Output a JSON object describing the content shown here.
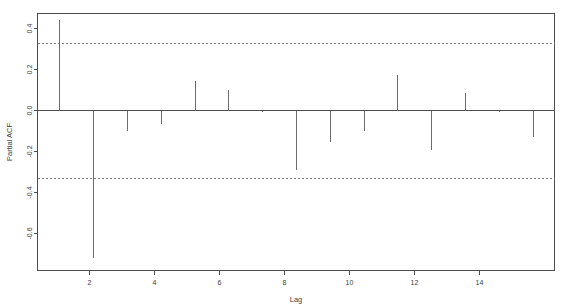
{
  "chart_data": {
    "type": "bar",
    "title": "",
    "subtitle": "",
    "xlabel": "Lag",
    "ylabel": "Partial ACF",
    "categories": [
      1,
      2,
      3,
      4,
      5,
      6,
      7,
      8,
      9,
      10,
      11,
      12,
      13,
      14,
      15
    ],
    "values": [
      0.44,
      -0.72,
      -0.1,
      -0.065,
      0.145,
      0.1,
      -0.005,
      -0.29,
      -0.155,
      -0.1,
      0.175,
      -0.195,
      0.085,
      -0.005,
      -0.13
    ],
    "series": [
      {
        "name": "Partial ACF",
        "values": [
          0.44,
          -0.72,
          -0.1,
          -0.065,
          0.145,
          0.1,
          -0.005,
          -0.29,
          -0.155,
          -0.1,
          0.175,
          -0.195,
          0.085,
          -0.005,
          -0.13
        ]
      }
    ],
    "xlim": [
      0.35,
      15.65
    ],
    "ylim": [
      -0.78,
      0.47
    ],
    "x_ticks": [
      2,
      4,
      6,
      8,
      10,
      12,
      14
    ],
    "x_tick_labels": [
      "2",
      "4",
      "6",
      "8",
      "10",
      "12",
      "14"
    ],
    "y_ticks": [
      0.4,
      0.2,
      0.0,
      -0.2,
      -0.4,
      -0.6
    ],
    "y_tick_labels": [
      "0.4",
      "0.2",
      "0.0",
      "-0.2",
      "-0.4",
      "-0.6"
    ],
    "confidence_bands": [
      0.33,
      -0.33
    ],
    "confidence_style": "dashed",
    "grid": false,
    "legend": "none",
    "zero_line": 0.0,
    "colors": {
      "spike": "#6b6b6b",
      "axis": "#4d4d4d",
      "confidence": "#7a7a7a",
      "background": "#ffffff",
      "text": "#3d3d3d"
    }
  }
}
